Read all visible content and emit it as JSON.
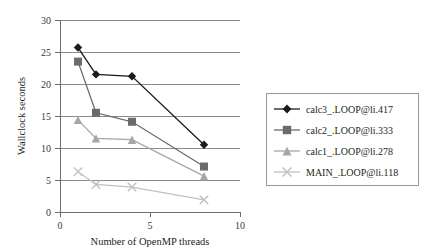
{
  "chart_data": {
    "type": "line",
    "title": "",
    "xlabel": "Number of OpenMP threads",
    "ylabel": "Wallclock seconds",
    "xlim": [
      0,
      10
    ],
    "ylim": [
      0,
      30
    ],
    "xticks": [
      0,
      5,
      10
    ],
    "xtick_labels": [
      "0",
      "5",
      "10"
    ],
    "yticks": [
      0,
      5,
      10,
      15,
      20,
      25,
      30
    ],
    "ytick_labels": [
      "0",
      "5",
      "10",
      "15",
      "20",
      "25",
      "30"
    ],
    "grid": "horizontal",
    "legend_position": "right-outside",
    "x": [
      1,
      2,
      4,
      8
    ],
    "series": [
      {
        "name": "calc3_.LOOP@li.417",
        "marker": "diamond",
        "color": "#1a1a1a",
        "values": [
          25.7,
          21.5,
          21.2,
          10.5
        ]
      },
      {
        "name": "calc2_.LOOP@li.333",
        "marker": "square",
        "color": "#6b6b6b",
        "values": [
          23.5,
          15.5,
          14.1,
          7.1
        ]
      },
      {
        "name": "calc1_.LOOP@li.278",
        "marker": "triangle",
        "color": "#a6a6a6",
        "values": [
          14.4,
          11.5,
          11.3,
          5.6
        ]
      },
      {
        "name": "MAIN_.LOOP@li.118",
        "marker": "x",
        "color": "#c0c0c0",
        "values": [
          6.3,
          4.3,
          3.9,
          1.9
        ]
      }
    ]
  },
  "legend": {
    "entries": [
      {
        "label": "calc3_.LOOP@li.417"
      },
      {
        "label": "calc2_.LOOP@li.333"
      },
      {
        "label": "calc1_.LOOP@li.278"
      },
      {
        "label": "MAIN_.LOOP@li.118"
      }
    ]
  },
  "axes": {
    "x_title": "Number of OpenMP threads",
    "y_title": "Wallclock seconds"
  }
}
